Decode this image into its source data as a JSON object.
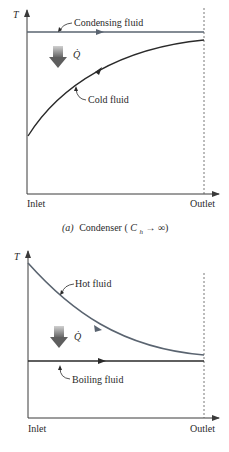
{
  "colors": {
    "axis": "#3a3a3a",
    "condensing_line": "#5a6470",
    "cold_curve": "#2a2a2a",
    "hot_curve": "#5a6470",
    "boiling_line": "#2a2a2a",
    "heat_arrow_top": "#c8c8c8",
    "heat_arrow_bottom": "#6a6a6a"
  },
  "diagram_a": {
    "y_axis_label": "T",
    "heat_label": "Q̇",
    "condensing_label": "Condensing fluid",
    "cold_label": "Cold fluid",
    "x_start_label": "Inlet",
    "x_end_label": "Outlet",
    "caption_prefix": "(a)",
    "caption_text": "Condenser (",
    "caption_c": "C",
    "caption_sub": "h",
    "caption_arrow": "→",
    "caption_inf": "∞)"
  },
  "diagram_b": {
    "y_axis_label": "T",
    "heat_label": "Q̇",
    "hot_label": "Hot fluid",
    "boiling_label": "Boiling fluid",
    "x_start_label": "Inlet",
    "x_end_label": "Outlet"
  }
}
